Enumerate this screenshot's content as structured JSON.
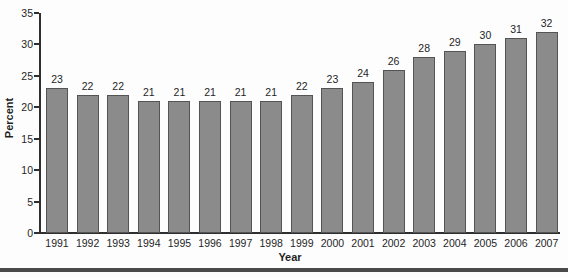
{
  "chart_data": {
    "type": "bar",
    "title": "",
    "xlabel": "Year",
    "ylabel": "Percent",
    "categories": [
      "1991",
      "1992",
      "1993",
      "1994",
      "1995",
      "1996",
      "1997",
      "1998",
      "1999",
      "2000",
      "2001",
      "2002",
      "2003",
      "2004",
      "2005",
      "2006",
      "2007"
    ],
    "values": [
      23,
      22,
      22,
      21,
      21,
      21,
      21,
      21,
      22,
      23,
      24,
      26,
      28,
      29,
      30,
      31,
      32
    ],
    "ylim": [
      0,
      35
    ],
    "yticks": [
      0,
      5,
      10,
      15,
      20,
      25,
      30,
      35
    ],
    "grid": false,
    "legend": "none",
    "data_labels": true,
    "bar_fill": "#8b8b8b",
    "bar_border": "#545454",
    "axis_color": "#2f2f2f",
    "label_color": "#1f1f1f"
  },
  "divider": {
    "color": "#4a4a4a"
  }
}
